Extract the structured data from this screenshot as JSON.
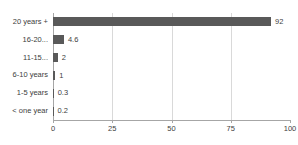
{
  "chart_data": {
    "type": "bar",
    "orientation": "horizontal",
    "title": "",
    "xlabel": "",
    "ylabel": "",
    "categories": [
      "20 years +",
      "16-20...",
      "11-15...",
      "6-10 years",
      "1-5 years",
      "< one year"
    ],
    "values": [
      92,
      4.6,
      2,
      1,
      0.3,
      0.2
    ],
    "value_labels": [
      "92",
      "4.6",
      "2",
      "1",
      "0.3",
      "0.2"
    ],
    "xlim": [
      0,
      100
    ],
    "xticks": [
      0,
      25,
      50,
      75,
      100
    ],
    "xtick_labels": [
      "0",
      "25",
      "50",
      "75",
      "100"
    ],
    "gridlines": [
      25,
      50,
      75
    ],
    "grid": true,
    "legend": false,
    "colors": {
      "bar": "#595959",
      "grid": "#d9d9d9",
      "axis": "#a6a6a6",
      "text": "#404040",
      "background": "#ffffff"
    }
  }
}
